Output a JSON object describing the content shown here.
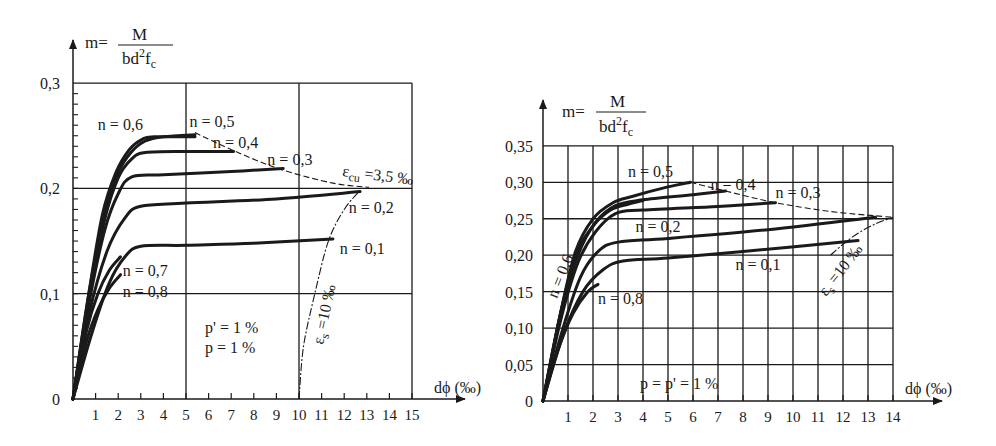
{
  "chart_data": [
    {
      "type": "line",
      "title": "",
      "ylabel": "m = M / (bd²f_c)",
      "ylabel_parts": {
        "lhs": "m=",
        "num": "M",
        "den_a": "bd",
        "den_sup": "2",
        "den_b": "f",
        "den_sub": "c"
      },
      "xlabel": "dϕ (‰)",
      "xlim": [
        0,
        15
      ],
      "ylim": [
        0,
        0.3
      ],
      "x_ticks": [
        "1",
        "2",
        "3",
        "4",
        "5",
        "6",
        "7",
        "8",
        "9",
        "10",
        "11",
        "12",
        "13",
        "14",
        "15"
      ],
      "y_ticks": [
        "0",
        "0,1",
        "0,2",
        "0,3"
      ],
      "grid": {
        "x": [
          5,
          10,
          15
        ],
        "y": [
          0.1,
          0.2,
          0.3
        ]
      },
      "annotation_box": [
        "p' = 1 %",
        "p = 1 %"
      ],
      "limit_curves": [
        {
          "name": "εcu = 3,5 ‰",
          "label_main": "ε",
          "label_sub": "cu",
          "label_rest": " =3,5 ‰",
          "style": "dashed",
          "x": [
            5.4,
            7.2,
            9.2,
            11.5,
            13.1
          ],
          "y": [
            0.253,
            0.235,
            0.218,
            0.205,
            0.201
          ]
        },
        {
          "name": "εs = 10 ‰",
          "label_main": "ε",
          "label_sub": "s",
          "label_rest": " =10 ‰",
          "style": "dashdot",
          "x": [
            10.0,
            10.2,
            10.7,
            11.3,
            12.0,
            12.7
          ],
          "y": [
            0.0,
            0.05,
            0.1,
            0.15,
            0.18,
            0.198
          ]
        }
      ],
      "series": [
        {
          "name": "n = 0,1",
          "x": [
            0,
            0.8,
            1.6,
            2.3,
            3,
            5,
            8,
            11.5
          ],
          "y": [
            0,
            0.06,
            0.11,
            0.135,
            0.145,
            0.146,
            0.148,
            0.152
          ]
        },
        {
          "name": "n = 0,2",
          "x": [
            0,
            0.7,
            1.5,
            2.3,
            3,
            5,
            9,
            12.7
          ],
          "y": [
            0,
            0.08,
            0.14,
            0.172,
            0.183,
            0.186,
            0.19,
            0.197
          ]
        },
        {
          "name": "n = 0,3",
          "x": [
            0,
            0.7,
            1.4,
            2,
            2.6,
            4,
            7,
            9.3
          ],
          "y": [
            0,
            0.09,
            0.16,
            0.195,
            0.211,
            0.213,
            0.216,
            0.219
          ]
        },
        {
          "name": "n = 0,4",
          "x": [
            0,
            0.7,
            1.4,
            2,
            2.6,
            3.2,
            5,
            7.1
          ],
          "y": [
            0,
            0.095,
            0.17,
            0.21,
            0.228,
            0.234,
            0.235,
            0.235
          ]
        },
        {
          "name": "n = 0,5",
          "x": [
            0,
            0.7,
            1.4,
            2,
            2.6,
            3.2,
            4,
            5.4
          ],
          "y": [
            0,
            0.1,
            0.175,
            0.215,
            0.235,
            0.245,
            0.249,
            0.251
          ]
        },
        {
          "name": "n = 0,6",
          "x": [
            0,
            0.7,
            1.3,
            1.9,
            2.5,
            3.1,
            3.6,
            5.4
          ],
          "y": [
            0,
            0.1,
            0.175,
            0.215,
            0.237,
            0.247,
            0.249,
            0.249
          ]
        },
        {
          "name": "n = 0,7",
          "x": [
            0,
            0.6,
            1.1,
            1.6,
            2.1
          ],
          "y": [
            0,
            0.065,
            0.1,
            0.122,
            0.135
          ]
        },
        {
          "name": "n = 0,8",
          "x": [
            0,
            0.6,
            1.1,
            1.6,
            2.1
          ],
          "y": [
            0,
            0.055,
            0.085,
            0.105,
            0.118
          ]
        }
      ],
      "series_labels": [
        {
          "text": "n = 0,6",
          "x": 1.1,
          "y": 0.255
        },
        {
          "text": "n = 0,5",
          "x": 5.15,
          "y": 0.258
        },
        {
          "text": "n = 0,4",
          "x": 6.2,
          "y": 0.238
        },
        {
          "text": "n = 0,3",
          "x": 8.6,
          "y": 0.222
        },
        {
          "text": "n = 0,2",
          "x": 12.2,
          "y": 0.177
        },
        {
          "text": "n = 0,1",
          "x": 11.8,
          "y": 0.138
        },
        {
          "text": "n = 0,7",
          "x": 2.2,
          "y": 0.117
        },
        {
          "text": "n = 0,8",
          "x": 2.2,
          "y": 0.097
        }
      ]
    },
    {
      "type": "line",
      "title": "",
      "ylabel": "m = M / (bd²f_c)",
      "ylabel_parts": {
        "lhs": "m=",
        "num": "M",
        "den_a": "bd",
        "den_sup": "2",
        "den_b": "f",
        "den_sub": "c"
      },
      "xlabel": "dϕ (‰)",
      "xlim": [
        0,
        14
      ],
      "ylim": [
        0,
        0.35
      ],
      "x_ticks": [
        "1",
        "2",
        "3",
        "4",
        "5",
        "6",
        "7",
        "8",
        "9",
        "10",
        "11",
        "12",
        "13",
        "14"
      ],
      "y_ticks": [
        "0",
        "0,05",
        "0,10",
        "0,15",
        "0,20",
        "0,25",
        "0,30",
        "0,35"
      ],
      "grid": {
        "x": [
          1,
          2,
          3,
          4,
          5,
          6,
          7,
          8,
          9,
          10,
          11,
          12,
          13,
          14
        ],
        "y": [
          0.05,
          0.1,
          0.15,
          0.2,
          0.25,
          0.3,
          0.35
        ]
      },
      "annotation_box": [
        "p = p' = 1 %"
      ],
      "limit_curves": [
        {
          "name": "εcu (dashed envelope)",
          "style": "dashed",
          "x": [
            5.9,
            7.3,
            9.3,
            11.5,
            13.3,
            14.0
          ],
          "y": [
            0.3,
            0.288,
            0.272,
            0.26,
            0.254,
            0.252
          ]
        },
        {
          "name": "εs = 10 ‰",
          "label_main": "ε",
          "label_sub": "s",
          "label_rest": " =10 ‰",
          "style": "dashdot",
          "x": [
            11.5,
            12.0,
            12.6,
            13.3,
            14.0
          ],
          "y": [
            0.2,
            0.215,
            0.23,
            0.243,
            0.252
          ]
        }
      ],
      "series": [
        {
          "name": "n = 0,1",
          "x": [
            0,
            0.8,
            1.6,
            2.4,
            3.2,
            5,
            8,
            12.6
          ],
          "y": [
            0,
            0.09,
            0.15,
            0.18,
            0.192,
            0.196,
            0.205,
            0.22
          ]
        },
        {
          "name": "n = 0,2",
          "x": [
            0,
            0.8,
            1.5,
            2.2,
            3,
            5,
            9,
            13.3
          ],
          "y": [
            0,
            0.1,
            0.17,
            0.205,
            0.218,
            0.223,
            0.235,
            0.252
          ]
        },
        {
          "name": "n = 0,3",
          "x": [
            0,
            0.7,
            1.4,
            2.1,
            2.9,
            4,
            7,
            9.3
          ],
          "y": [
            0,
            0.11,
            0.19,
            0.232,
            0.257,
            0.262,
            0.267,
            0.272
          ]
        },
        {
          "name": "n = 0,4",
          "x": [
            0,
            0.7,
            1.4,
            2.1,
            2.9,
            4,
            6,
            7.3
          ],
          "y": [
            0,
            0.12,
            0.2,
            0.245,
            0.268,
            0.276,
            0.283,
            0.288
          ]
        },
        {
          "name": "n = 0,5",
          "x": [
            0,
            0.7,
            1.3,
            2,
            2.8,
            3.6,
            4.8,
            5.9
          ],
          "y": [
            0,
            0.12,
            0.205,
            0.25,
            0.272,
            0.281,
            0.292,
            0.3
          ]
        },
        {
          "name": "n = 0,6",
          "x": [
            0,
            0.7,
            1.3,
            2,
            2.7,
            3.4,
            4.0
          ],
          "y": [
            0,
            0.12,
            0.2,
            0.24,
            0.262,
            0.27,
            0.275
          ]
        },
        {
          "name": "n = 0,8",
          "x": [
            0,
            0.6,
            1.2,
            1.8,
            2.2
          ],
          "y": [
            0,
            0.07,
            0.12,
            0.15,
            0.16
          ]
        }
      ],
      "series_labels": [
        {
          "text": "n = 0,5",
          "x": 3.4,
          "y": 0.307
        },
        {
          "text": "n = 0,4",
          "x": 6.7,
          "y": 0.29
        },
        {
          "text": "n = 0,3",
          "x": 9.3,
          "y": 0.279
        },
        {
          "text": "n = 0,2",
          "x": 3.7,
          "y": 0.232
        },
        {
          "text": "n = 0,1",
          "x": 7.7,
          "y": 0.18
        },
        {
          "text": "n = 0,8",
          "x": 2.2,
          "y": 0.133
        },
        {
          "text": "n = 0,6",
          "x": 0.55,
          "y": 0.14,
          "rotate": -68
        }
      ]
    }
  ]
}
